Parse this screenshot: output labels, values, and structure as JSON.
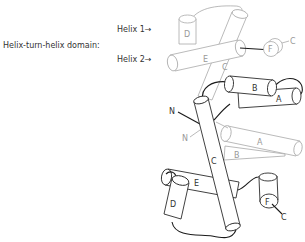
{
  "annotations": {
    "domain_label": "Helix-turn-helix domain:",
    "helix1_label": "Helix 1",
    "helix2_label": "Helix 2",
    "arrow_glyph": "→"
  },
  "subunit_back": {
    "color": "#a8a8a8",
    "helices": {
      "A": "A",
      "B": "B",
      "C": "C",
      "D": "D",
      "E": "E",
      "F": "F"
    },
    "n_term": "N",
    "c_term": "C"
  },
  "subunit_front": {
    "color": "#2b2b2b",
    "helices": {
      "A": "A",
      "B": "B",
      "C": "C",
      "D": "D",
      "E": "E",
      "F": "F"
    },
    "n_term": "N",
    "c_term": "C"
  }
}
